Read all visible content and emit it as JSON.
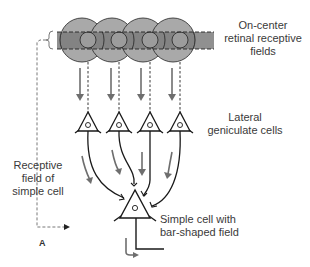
{
  "diagram": {
    "panel_label": "A",
    "labels": {
      "retinal_fields": [
        "On-center",
        "retinal receptive",
        "fields"
      ],
      "lgn_cells": [
        "Lateral",
        "geniculate cells"
      ],
      "receptive_field": [
        "Receptive",
        "field of",
        "simple cell"
      ],
      "simple_cell": [
        "Simple cell with",
        "bar-shaped field"
      ]
    },
    "colors": {
      "outer_circle": "#a9a9a9",
      "band": "#7a7a7a",
      "inner_circle": "#9a9a9a",
      "line": "#1a1a1a",
      "arrow": "#6e6e6e"
    },
    "retinal_fields_count": 4,
    "lgn_cells_count": 4
  }
}
